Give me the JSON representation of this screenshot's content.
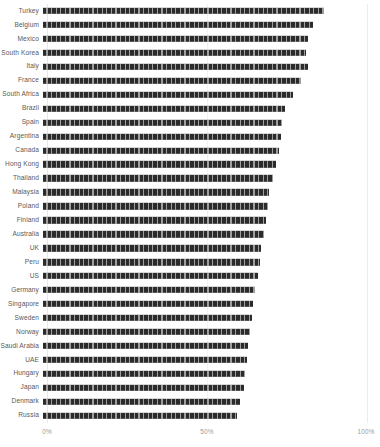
{
  "chart_data": {
    "type": "bar",
    "orientation": "horizontal",
    "title": "",
    "subtitle": "",
    "xlabel": "",
    "ylabel": "",
    "xlim": [
      0,
      100
    ],
    "grid": false,
    "legend": null,
    "axis": {
      "x_ticks": [
        "0%",
        "50%",
        "100%"
      ],
      "x_tick_values": [
        0,
        50,
        100
      ]
    },
    "bar_color": "#2b2b2b",
    "categories": [
      "Turkey",
      "Belgium",
      "Mexico",
      "South Korea",
      "Italy",
      "France",
      "South Africa",
      "Brazil",
      "Spain",
      "Argentina",
      "Canada",
      "Hong Kong",
      "Thailand",
      "Malaysia",
      "Poland",
      "Finland",
      "Australia",
      "UK",
      "Peru",
      "US",
      "Germany",
      "Singapore",
      "Sweden",
      "Norway",
      "Saudi Arabia",
      "UAE",
      "Hungary",
      "Japan",
      "Denmark",
      "Russia"
    ],
    "values": [
      87.5,
      84.0,
      82.5,
      82.0,
      82.5,
      80.5,
      78.0,
      75.5,
      74.5,
      74.0,
      73.5,
      72.5,
      71.5,
      70.5,
      70.0,
      69.5,
      69.0,
      68.0,
      67.5,
      67.0,
      66.0,
      65.5,
      65.0,
      64.5,
      64.0,
      63.5,
      63.0,
      62.5,
      61.5,
      60.5
    ]
  }
}
